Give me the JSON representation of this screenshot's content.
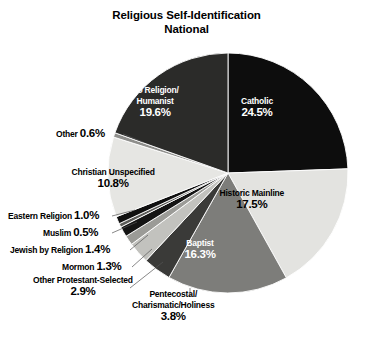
{
  "title": {
    "line1": "Religious Self-Identification",
    "line2": "National"
  },
  "chart_data": {
    "type": "pie",
    "title": "Religious Self-Identification National",
    "units": "percent",
    "start_angle_deg": 0,
    "direction": "clockwise",
    "center": [
      228,
      173
    ],
    "radius": 120,
    "categories": [
      "Catholic",
      "Historic Mainline",
      "Baptist",
      "Pentecostal/Charismatic/Holiness",
      "Other Protestant-Selected",
      "Mormon",
      "Jewish by Religion",
      "Muslim",
      "Eastern Religion",
      "Christian Unspecified",
      "Other",
      "No Religion/Humanist"
    ],
    "values": [
      24.5,
      17.5,
      16.3,
      3.8,
      2.9,
      1.3,
      1.4,
      0.5,
      1.0,
      10.8,
      0.6,
      19.6
    ],
    "colors": [
      "#0d0d0d",
      "#e3e3e0",
      "#7d7d7a",
      "#3a3a38",
      "#c2c2be",
      "#9b9b97",
      "#141414",
      "#5c5c59",
      "#101010",
      "#e6e6e3",
      "#8f8f8c",
      "#2b2b29"
    ],
    "legend": "none",
    "grid": false
  },
  "slices": [
    {
      "id": "catholic",
      "name": "Catholic",
      "pct": "24.5%",
      "label_color": "light",
      "x": 257,
      "y": 96
    },
    {
      "id": "historic-mainline",
      "name": "Historic Mainline",
      "pct": "17.5%",
      "label_color": "dark",
      "x": 252,
      "y": 188
    },
    {
      "id": "baptist",
      "name": "Baptist",
      "pct": "16.3%",
      "label_color": "light",
      "x": 200,
      "y": 238
    },
    {
      "id": "christian-unspecified",
      "name": "Christian Unspecified",
      "pct": "10.8%",
      "label_color": "dark",
      "x": 113,
      "y": 167
    },
    {
      "id": "no-religion-humanist",
      "name_line1": "No Religion/",
      "name_line2": "Humanist",
      "pct": "19.6%",
      "label_color": "light",
      "x": 155,
      "y": 85
    }
  ],
  "callouts": [
    {
      "id": "other",
      "text": "Other",
      "pct": "0.6%",
      "x": 56,
      "y": 128,
      "align": "left",
      "line": {
        "x1": 123,
        "y1": 134,
        "x2": 143,
        "y2": 142
      }
    },
    {
      "id": "eastern-religion",
      "text": "Eastern Religion",
      "pct": "1.0%",
      "x": 8,
      "y": 210,
      "align": "left",
      "line": {
        "x1": 112,
        "y1": 216,
        "x2": 135,
        "y2": 210
      }
    },
    {
      "id": "muslim",
      "text": "Muslim",
      "pct": "0.5%",
      "x": 43,
      "y": 227,
      "align": "left",
      "line": {
        "x1": 112,
        "y1": 233,
        "x2": 137,
        "y2": 222
      }
    },
    {
      "id": "jewish-by-religion",
      "text": "Jewish by Religion",
      "pct": "1.4%",
      "x": 10,
      "y": 244,
      "align": "left",
      "line": {
        "x1": 130,
        "y1": 250,
        "x2": 148,
        "y2": 235
      }
    },
    {
      "id": "mormon",
      "text": "Mormon",
      "pct": "1.3%",
      "x": 62,
      "y": 261,
      "align": "left",
      "line": {
        "x1": 132,
        "y1": 267,
        "x2": 152,
        "y2": 249
      }
    },
    {
      "id": "other-protestant-selected",
      "text": "Other Protestant-Selected",
      "pct": "2.9%",
      "x": 33,
      "y": 275,
      "align": "center-block",
      "line": {
        "x1": 130,
        "y1": 288,
        "x2": 163,
        "y2": 262
      }
    },
    {
      "id": "pentecostal-charismatic-holiness",
      "text_line1": "Pentecostal/",
      "text_line2": "Charismatic/Holiness",
      "pct": "3.8%",
      "x": 132,
      "y": 289,
      "align": "center-block",
      "line": {
        "x1": 190,
        "y1": 288,
        "x2": 190,
        "y2": 296
      }
    }
  ]
}
